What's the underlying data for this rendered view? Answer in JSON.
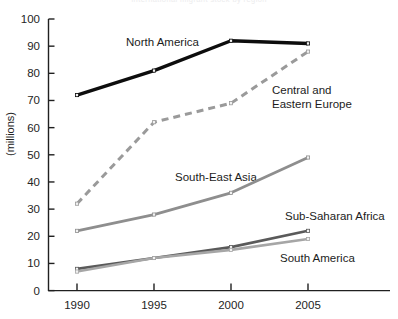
{
  "title_ghost": "International migrant stock by region",
  "axes": {
    "y_title": "(millions)",
    "y_ticks": [
      "100",
      "90",
      "80",
      "70",
      "60",
      "50",
      "40",
      "30",
      "20",
      "10",
      "0"
    ],
    "x_ticks": [
      "1990",
      "1995",
      "2000",
      "2005"
    ]
  },
  "labels": {
    "north_america": "North America",
    "central_eastern_europe_line1": "Central and",
    "central_eastern_europe_line2": "Eastern Europe",
    "south_east_asia": "South-East Asia",
    "sub_saharan_africa": "Sub-Saharan Africa",
    "south_america": "South America"
  },
  "colors": {
    "north_america": "#0d0d0d",
    "central_eastern_europe": "#9a9a9a",
    "south_east_asia": "#8e8e8e",
    "sub_saharan_africa": "#5a5a5a",
    "south_america": "#a6a6a6",
    "axis": "#202020"
  },
  "chart_data": {
    "type": "line",
    "title": "International migrant stock by region",
    "xlabel": "",
    "ylabel": "(millions)",
    "x": [
      1990,
      1995,
      2000,
      2005
    ],
    "xlim": [
      1988.5,
      2006.8
    ],
    "ylim": [
      0,
      100
    ],
    "ytick_step": 10,
    "grid": false,
    "legend": "inline-labels",
    "series": [
      {
        "name": "North America",
        "values": [
          72,
          81,
          92,
          91
        ],
        "style": "solid",
        "color": "#0d0d0d",
        "width": 3.4
      },
      {
        "name": "Central and Eastern Europe",
        "values": [
          32,
          62,
          69,
          88
        ],
        "style": "dashed",
        "color": "#9a9a9a",
        "width": 3.0
      },
      {
        "name": "South-East Asia",
        "values": [
          22,
          28,
          36,
          49
        ],
        "style": "solid",
        "color": "#8e8e8e",
        "width": 2.8
      },
      {
        "name": "Sub-Saharan Africa",
        "values": [
          8,
          12,
          16,
          22
        ],
        "style": "solid",
        "color": "#5a5a5a",
        "width": 2.6
      },
      {
        "name": "South America",
        "values": [
          7,
          12,
          15,
          19
        ],
        "style": "solid",
        "color": "#a6a6a6",
        "width": 2.6
      }
    ]
  }
}
